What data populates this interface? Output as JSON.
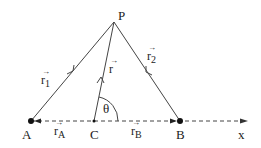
{
  "diagram": {
    "title": "",
    "points": {
      "P": {
        "label": "P",
        "x": 114,
        "y": 22
      },
      "A": {
        "label": "A",
        "x": 31,
        "y": 121
      },
      "C": {
        "label": "C",
        "x": 94,
        "y": 121
      },
      "B": {
        "label": "B",
        "x": 180,
        "y": 121
      }
    },
    "axis": {
      "label": "x",
      "style": "dashed",
      "from_x": 31,
      "to_x": 248,
      "y": 121
    },
    "vectors": [
      {
        "name": "r1",
        "symbol": "r",
        "subscript": "1",
        "from": "A",
        "to": "P"
      },
      {
        "name": "r",
        "symbol": "r",
        "subscript": "",
        "from": "C",
        "to": "P"
      },
      {
        "name": "r2",
        "symbol": "r",
        "subscript": "2",
        "from": "B",
        "to": "P"
      },
      {
        "name": "rA",
        "symbol": "r",
        "subscript": "A",
        "from": "C",
        "to": "A"
      },
      {
        "name": "rB",
        "symbol": "r",
        "subscript": "B",
        "from": "C",
        "to": "B"
      }
    ],
    "angle": {
      "label": "θ",
      "vertex": "C",
      "between": [
        "r",
        "x-axis"
      ]
    },
    "vector_arrow_glyph": "→",
    "colors": {
      "line": "#333333",
      "point": "#111111",
      "text": "#222222"
    }
  }
}
